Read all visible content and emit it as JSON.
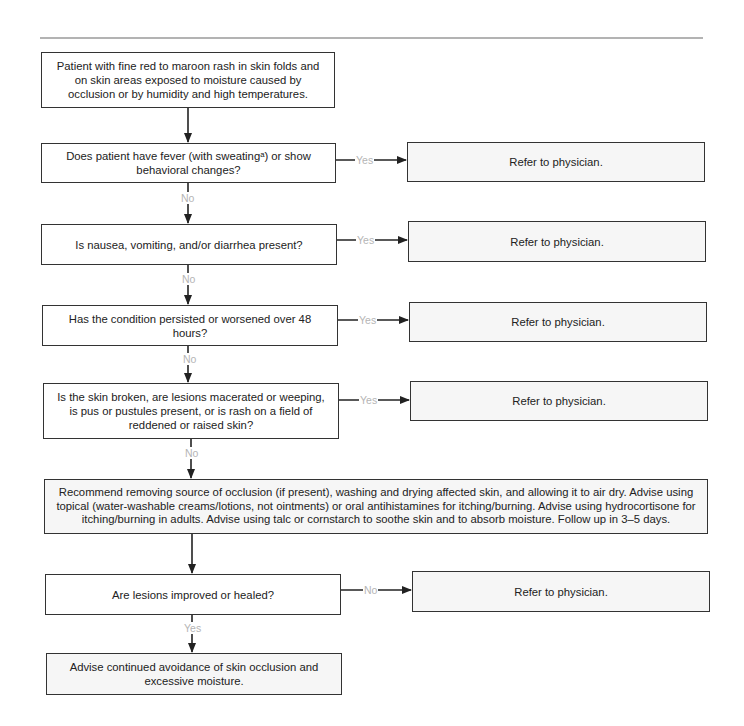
{
  "flowchart": {
    "start": "Patient with fine red to maroon rash in skin folds and on skin areas exposed to moisture caused by occlusion or by humidity and high temperatures.",
    "questions": [
      {
        "text": "Does patient have fever (with sweatingᵃ) or show behavioral changes?",
        "branch_label": "Yes",
        "continue_label": "No"
      },
      {
        "text": "Is nausea, vomiting, and/or diarrhea present?",
        "branch_label": "Yes",
        "continue_label": "No"
      },
      {
        "text": "Has the condition persisted or worsened over 48 hours?",
        "branch_label": "Yes",
        "continue_label": "No"
      },
      {
        "text": "Is the skin broken, are lesions macerated or weeping, is pus or pustules present, or is rash on a field of reddened or raised skin?",
        "branch_label": "Yes",
        "continue_label": "No"
      }
    ],
    "recommendation": "Recommend removing source of occlusion (if present), washing and drying affected skin, and allowing it to air dry. Advise using topical (water-washable creams/lotions, not ointments) or oral antihistamines for itching/burning. Advise using hydrocortisone for itching/burning in adults. Advise using talc or cornstarch to soothe skin and to absorb moisture. Follow up in 3–5 days.",
    "followup_question": {
      "text": "Are lesions improved or healed?",
      "branch_label": "No",
      "continue_label": "Yes"
    },
    "refer_text": "Refer to physician.",
    "final": "Advise continued avoidance of skin occlusion and excessive moisture."
  }
}
